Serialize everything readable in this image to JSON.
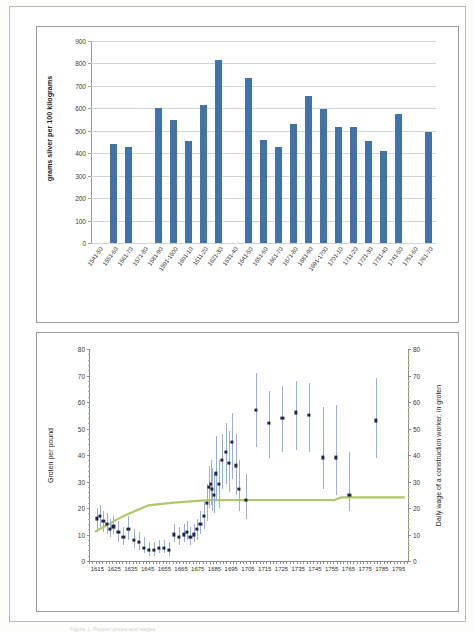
{
  "document": {
    "caption": "Figure 1. Pepper prices and wages"
  },
  "chart_data": [
    {
      "type": "bar",
      "name": "pepper-price-bar-chart",
      "title": "",
      "xlabel": "",
      "ylabel": "grams silver per 100 kilograms",
      "ylim": [
        0,
        900
      ],
      "yticks": [
        0,
        100,
        200,
        300,
        400,
        500,
        600,
        700,
        800,
        900
      ],
      "grid": true,
      "bar_color": "#4273a8",
      "categories": [
        "1541-50",
        "1551-60",
        "1561-70",
        "1571-80",
        "1581-90",
        "1591-1600",
        "1601-10",
        "1611-20",
        "1621-30",
        "1631-40",
        "1641-50",
        "1651-60",
        "1661-70",
        "1671-80",
        "1681-90",
        "1691-1700",
        "1701-10",
        "1711-20",
        "1721-30",
        "1731-40",
        "1741-50",
        "1751-60",
        "1761-70"
      ],
      "values": [
        null,
        440,
        430,
        null,
        600,
        550,
        455,
        613,
        815,
        null,
        737,
        458,
        428,
        530,
        655,
        596,
        515,
        517,
        455,
        412,
        577,
        null,
        495
      ]
    },
    {
      "type": "scatter",
      "name": "groten-per-pound-scatter-chart",
      "title": "",
      "xlabel": "",
      "ylabel": "Groten per pound",
      "ylabel_right": "Daily wage of a construction worker, in groten",
      "xlim": [
        1610,
        1800
      ],
      "ylim": [
        0,
        80
      ],
      "yticks": [
        0,
        10,
        20,
        30,
        40,
        50,
        60,
        70,
        80
      ],
      "yticks_right": [
        0,
        10,
        20,
        30,
        40,
        50,
        60,
        70,
        80
      ],
      "xticks": [
        1615,
        1625,
        1635,
        1645,
        1655,
        1665,
        1675,
        1685,
        1695,
        1705,
        1715,
        1725,
        1735,
        1745,
        1755,
        1765,
        1775,
        1785,
        1795
      ],
      "grid": false,
      "dot_color": "#1f2547",
      "whisker_color": "#9aafd4",
      "trend_color": "#b0c86b",
      "series": [
        {
          "name": "Groten per pound (with range)",
          "points": [
            {
              "x": 1614,
              "y": 16,
              "lo": 12,
              "hi": 20
            },
            {
              "x": 1616,
              "y": 17,
              "lo": 13,
              "hi": 21
            },
            {
              "x": 1618,
              "y": 15,
              "lo": 11,
              "hi": 19
            },
            {
              "x": 1620,
              "y": 14,
              "lo": 10,
              "hi": 18
            },
            {
              "x": 1622,
              "y": 12,
              "lo": 9,
              "hi": 16
            },
            {
              "x": 1624,
              "y": 13,
              "lo": 10,
              "hi": 17
            },
            {
              "x": 1627,
              "y": 11,
              "lo": 7,
              "hi": 15
            },
            {
              "x": 1630,
              "y": 9,
              "lo": 6,
              "hi": 13
            },
            {
              "x": 1633,
              "y": 12,
              "lo": 8,
              "hi": 17
            },
            {
              "x": 1636,
              "y": 8,
              "lo": 5,
              "hi": 12
            },
            {
              "x": 1639,
              "y": 7,
              "lo": 4,
              "hi": 11
            },
            {
              "x": 1642,
              "y": 5,
              "lo": 3,
              "hi": 9
            },
            {
              "x": 1645,
              "y": 4,
              "lo": 2,
              "hi": 7
            },
            {
              "x": 1648,
              "y": 4,
              "lo": 2,
              "hi": 7
            },
            {
              "x": 1651,
              "y": 5,
              "lo": 3,
              "hi": 8
            },
            {
              "x": 1654,
              "y": 5,
              "lo": 3,
              "hi": 8
            },
            {
              "x": 1657,
              "y": 4,
              "lo": 2,
              "hi": 7
            },
            {
              "x": 1660,
              "y": 10,
              "lo": 7,
              "hi": 14
            },
            {
              "x": 1663,
              "y": 9,
              "lo": 6,
              "hi": 13
            },
            {
              "x": 1666,
              "y": 10,
              "lo": 7,
              "hi": 14
            },
            {
              "x": 1668,
              "y": 11,
              "lo": 8,
              "hi": 15
            },
            {
              "x": 1670,
              "y": 9,
              "lo": 6,
              "hi": 13
            },
            {
              "x": 1672,
              "y": 10,
              "lo": 7,
              "hi": 14
            },
            {
              "x": 1674,
              "y": 12,
              "lo": 8,
              "hi": 16
            },
            {
              "x": 1676,
              "y": 14,
              "lo": 10,
              "hi": 19
            },
            {
              "x": 1678,
              "y": 17,
              "lo": 12,
              "hi": 23
            },
            {
              "x": 1680,
              "y": 22,
              "lo": 15,
              "hi": 29
            },
            {
              "x": 1681,
              "y": 28,
              "lo": 20,
              "hi": 36
            },
            {
              "x": 1682,
              "y": 29,
              "lo": 21,
              "hi": 38
            },
            {
              "x": 1683,
              "y": 27,
              "lo": 19,
              "hi": 35
            },
            {
              "x": 1684,
              "y": 25,
              "lo": 18,
              "hi": 33
            },
            {
              "x": 1685,
              "y": 33,
              "lo": 23,
              "hi": 47
            },
            {
              "x": 1687,
              "y": 29,
              "lo": 20,
              "hi": 38
            },
            {
              "x": 1689,
              "y": 38,
              "lo": 27,
              "hi": 48
            },
            {
              "x": 1691,
              "y": 41,
              "lo": 29,
              "hi": 52
            },
            {
              "x": 1693,
              "y": 37,
              "lo": 26,
              "hi": 49
            },
            {
              "x": 1695,
              "y": 45,
              "lo": 31,
              "hi": 56
            },
            {
              "x": 1697,
              "y": 36,
              "lo": 25,
              "hi": 48
            },
            {
              "x": 1699,
              "y": 27,
              "lo": 19,
              "hi": 38
            },
            {
              "x": 1703,
              "y": 23,
              "lo": 16,
              "hi": 33
            },
            {
              "x": 1709,
              "y": 57,
              "lo": 43,
              "hi": 71
            },
            {
              "x": 1717,
              "y": 52,
              "lo": 39,
              "hi": 64
            },
            {
              "x": 1725,
              "y": 54,
              "lo": 41,
              "hi": 66
            },
            {
              "x": 1733,
              "y": 56,
              "lo": 42,
              "hi": 68
            },
            {
              "x": 1741,
              "y": 55,
              "lo": 41,
              "hi": 67
            },
            {
              "x": 1749,
              "y": 39,
              "lo": 27,
              "hi": 58
            },
            {
              "x": 1757,
              "y": 39,
              "lo": 25,
              "hi": 59
            },
            {
              "x": 1765,
              "y": 25,
              "lo": 19,
              "hi": 41
            },
            {
              "x": 1781,
              "y": 53,
              "lo": 39,
              "hi": 69
            }
          ]
        },
        {
          "name": "Daily wage of a construction worker",
          "points": [
            {
              "x": 1613,
              "y": 11
            },
            {
              "x": 1630,
              "y": 17
            },
            {
              "x": 1645,
              "y": 21
            },
            {
              "x": 1660,
              "y": 22
            },
            {
              "x": 1680,
              "y": 23
            },
            {
              "x": 1700,
              "y": 23
            },
            {
              "x": 1730,
              "y": 23
            },
            {
              "x": 1756,
              "y": 23
            },
            {
              "x": 1760,
              "y": 24
            },
            {
              "x": 1798,
              "y": 24
            }
          ]
        }
      ]
    }
  ]
}
